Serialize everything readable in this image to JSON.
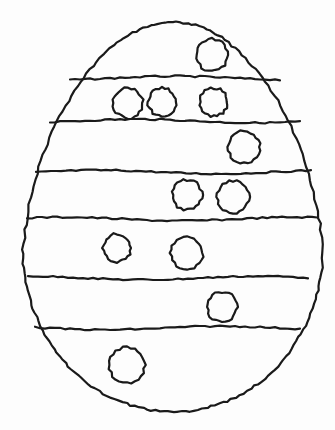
{
  "title": "Easter egg coloring page",
  "colors": {
    "background": "#fdfdfd",
    "line": "#1a1a1a"
  },
  "egg": {
    "center_x": 173,
    "top_y": 22,
    "bottom_y": 412,
    "half_width": 150,
    "widest_y": 250
  },
  "stripes": [
    {
      "y": 78,
      "x1": 70,
      "x2": 280
    },
    {
      "y": 121,
      "x1": 50,
      "x2": 300
    },
    {
      "y": 172,
      "x1": 36,
      "x2": 314
    },
    {
      "y": 219,
      "x1": 27,
      "x2": 321
    },
    {
      "y": 278,
      "x1": 28,
      "x2": 312
    },
    {
      "y": 328,
      "x1": 35,
      "x2": 300
    }
  ],
  "dots": [
    {
      "cx": 212,
      "cy": 55,
      "r": 16
    },
    {
      "cx": 128,
      "cy": 103,
      "r": 15
    },
    {
      "cx": 162,
      "cy": 102,
      "r": 14
    },
    {
      "cx": 214,
      "cy": 102,
      "r": 14
    },
    {
      "cx": 244,
      "cy": 147,
      "r": 16
    },
    {
      "cx": 187,
      "cy": 195,
      "r": 15
    },
    {
      "cx": 233,
      "cy": 197,
      "r": 16
    },
    {
      "cx": 117,
      "cy": 248,
      "r": 14
    },
    {
      "cx": 187,
      "cy": 253,
      "r": 16
    },
    {
      "cx": 222,
      "cy": 307,
      "r": 15
    },
    {
      "cx": 127,
      "cy": 365,
      "r": 18
    }
  ]
}
